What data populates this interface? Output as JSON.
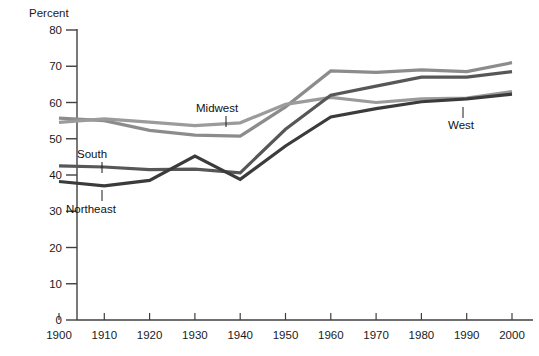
{
  "chart_data": {
    "type": "line",
    "title": "",
    "subtitle": "",
    "xlabel": "",
    "ylabel": "Percent",
    "unit_label": "Percent",
    "x": [
      1900,
      1910,
      1920,
      1930,
      1940,
      1950,
      1960,
      1970,
      1980,
      1990,
      2000
    ],
    "xticklabels": [
      "1900",
      "1910",
      "1920",
      "1930",
      "1940",
      "1950",
      "1960",
      "1970",
      "1980",
      "1990",
      "2000"
    ],
    "yticks": [
      0,
      10,
      20,
      30,
      40,
      50,
      60,
      70,
      80
    ],
    "yticklabels": [
      "0",
      "10",
      "20",
      "30",
      "40",
      "50",
      "60",
      "70",
      "80"
    ],
    "xlim": [
      1900,
      2000
    ],
    "ylim": [
      0,
      80
    ],
    "grid": false,
    "legend_position": "inline-annotations",
    "series": [
      {
        "name": "Midwest",
        "color": "#8c8c8c",
        "values": [
          55.7,
          55.0,
          52.3,
          51.0,
          50.7,
          58.8,
          68.7,
          68.3,
          69.0,
          68.5,
          71.0
        ]
      },
      {
        "name": "West",
        "color": "#9b9b9b",
        "values": [
          54.5,
          55.5,
          54.6,
          53.6,
          54.4,
          59.5,
          61.4,
          60.0,
          61.0,
          61.2,
          63.0
        ]
      },
      {
        "name": "South",
        "color": "#575757",
        "values": [
          42.5,
          42.2,
          41.5,
          41.6,
          40.6,
          52.6,
          62.0,
          64.5,
          67.0,
          67.0,
          68.5
        ]
      },
      {
        "name": "Northeast",
        "color": "#3b3b3b",
        "values": [
          38.2,
          37.0,
          38.5,
          45.2,
          38.8,
          48.0,
          56.0,
          58.3,
          60.2,
          61.0,
          62.3
        ]
      }
    ],
    "annotations": [
      {
        "label": "Midwest",
        "text_x": 196,
        "text_y": 112,
        "leader_x": 226,
        "leader_y1": 116,
        "leader_y2": 127
      },
      {
        "label": "West",
        "text_x": 448,
        "text_y": 129,
        "leader_x": 463,
        "leader_y1": 118,
        "leader_y2": 107
      },
      {
        "label": "South",
        "text_x": 77,
        "text_y": 158,
        "leader_x": 102,
        "leader_y1": 162,
        "leader_y2": 173
      },
      {
        "label": "Northeast",
        "text_x": 66,
        "text_y": 213,
        "leader_x": 102,
        "leader_y1": 201,
        "leader_y2": 190
      }
    ],
    "axis_color": "#3f3f3f",
    "text_color": "#1a1a1a"
  }
}
